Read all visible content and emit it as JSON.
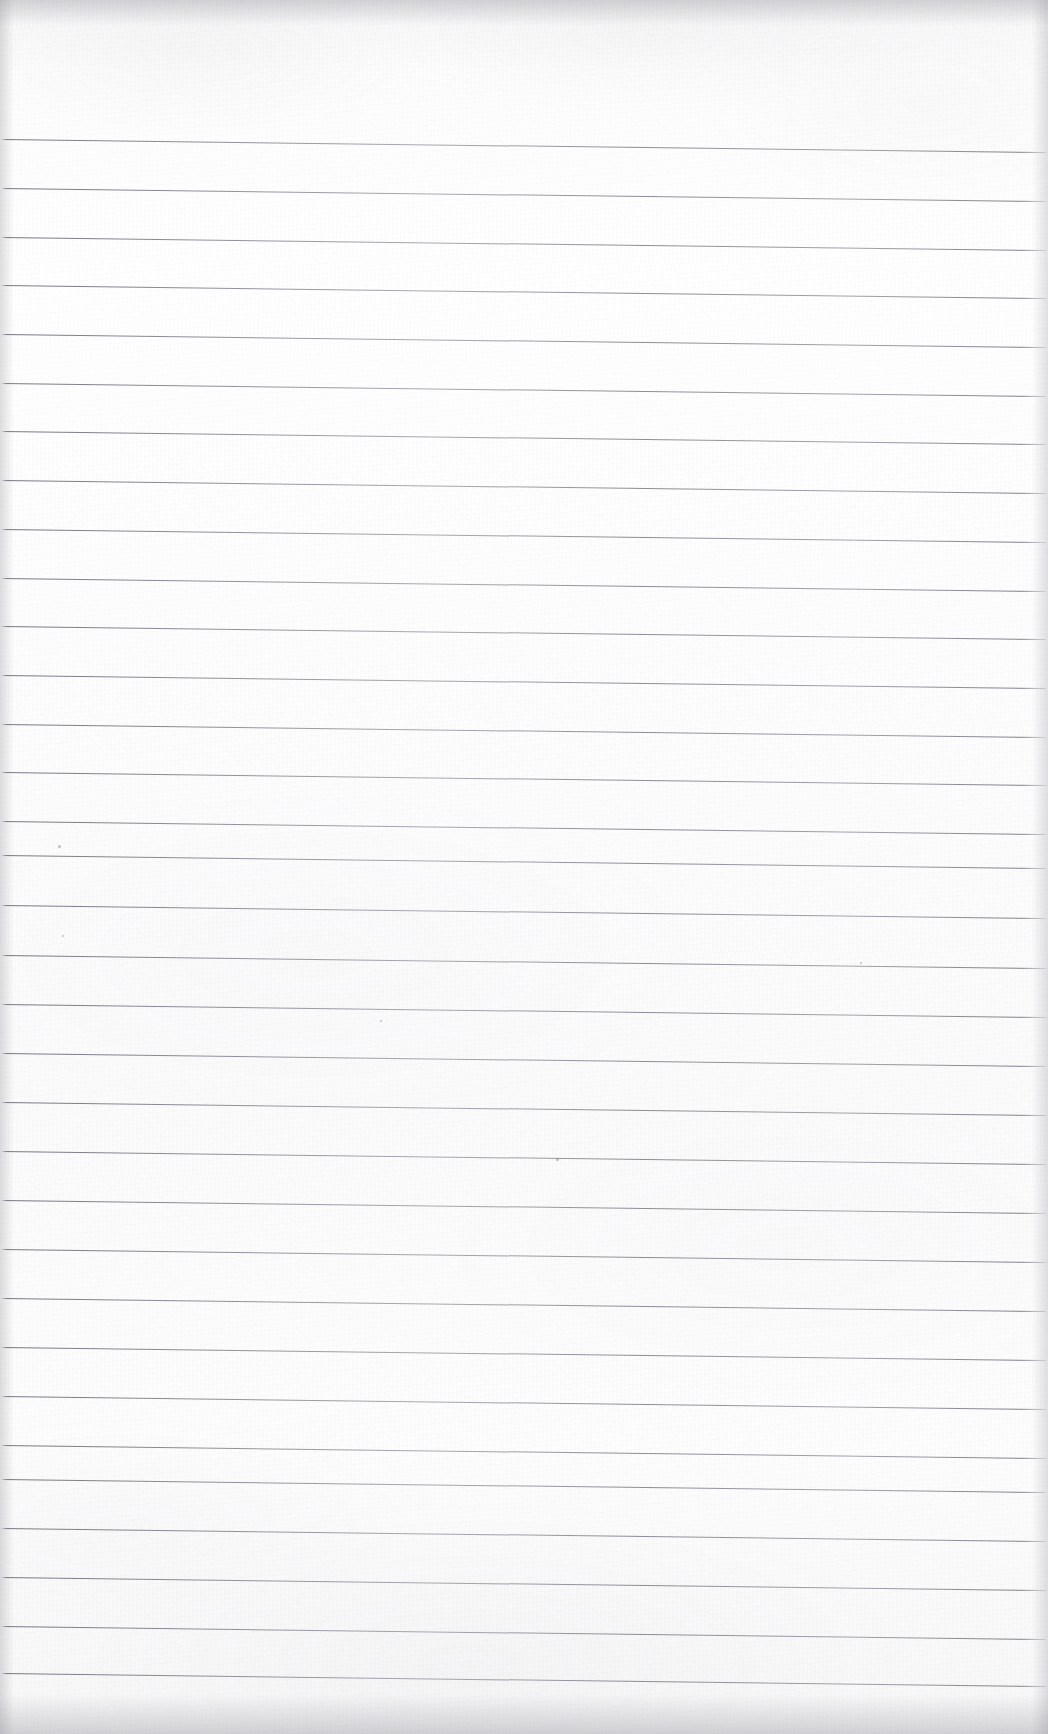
{
  "document": {
    "kind": "scanned-ruled-notebook-page",
    "title": "Blank Lined Paper Scan",
    "page_width": 1048,
    "page_height": 1734,
    "text_content": "",
    "handwriting": "none",
    "printed_text": "none"
  },
  "paper": {
    "background_color": "#fdfdfe",
    "tint_color": "#f7f7f8",
    "edge_shadow_color": "#7d7d87",
    "texture": "fibrous scan grain with faint cloudy blotches"
  },
  "ruling": {
    "line_color": "#6c6c78",
    "line_thickness_px": 1,
    "line_spacing_px": 49,
    "line_count": 32,
    "first_line_y_px": 139,
    "last_line_y_px": 1673,
    "left_margin_px": 2,
    "right_end_px": 1046,
    "slope_degrees": 0.72,
    "slope_direction": "descending-left-to-right",
    "vertical_margin_rule": "none",
    "top_blank_band_px": 139,
    "bottom_blank_band_px": 61,
    "lines": [
      {
        "index": 1,
        "y": 139
      },
      {
        "index": 2,
        "y": 188
      },
      {
        "index": 3,
        "y": 237
      },
      {
        "index": 4,
        "y": 285
      },
      {
        "index": 5,
        "y": 334
      },
      {
        "index": 6,
        "y": 383
      },
      {
        "index": 7,
        "y": 431
      },
      {
        "index": 8,
        "y": 480
      },
      {
        "index": 9,
        "y": 529
      },
      {
        "index": 10,
        "y": 578
      },
      {
        "index": 11,
        "y": 626
      },
      {
        "index": 12,
        "y": 675
      },
      {
        "index": 13,
        "y": 724
      },
      {
        "index": 14,
        "y": 772
      },
      {
        "index": 15,
        "y": 821
      },
      {
        "index": 16,
        "y": 855
      },
      {
        "index": 17,
        "y": 905
      },
      {
        "index": 18,
        "y": 955
      },
      {
        "index": 19,
        "y": 1004
      },
      {
        "index": 20,
        "y": 1053
      },
      {
        "index": 21,
        "y": 1102
      },
      {
        "index": 22,
        "y": 1151
      },
      {
        "index": 23,
        "y": 1200
      },
      {
        "index": 24,
        "y": 1249
      },
      {
        "index": 25,
        "y": 1298
      },
      {
        "index": 26,
        "y": 1347
      },
      {
        "index": 27,
        "y": 1396
      },
      {
        "index": 28,
        "y": 1445
      },
      {
        "index": 29,
        "y": 1479
      },
      {
        "index": 30,
        "y": 1528
      },
      {
        "index": 31,
        "y": 1577
      },
      {
        "index": 32,
        "y": 1626
      },
      {
        "index": 33,
        "y": 1673
      }
    ]
  },
  "artifacts": {
    "specks": [
      {
        "name": "speck-upper-left",
        "x": 58,
        "y": 845,
        "size": 3
      },
      {
        "name": "speck-mid-left",
        "x": 62,
        "y": 935,
        "size": 2
      },
      {
        "name": "speck-center",
        "x": 556,
        "y": 1158,
        "size": 3
      },
      {
        "name": "speck-right-rule",
        "x": 860,
        "y": 962,
        "size": 2
      },
      {
        "name": "speck-lower-center",
        "x": 380,
        "y": 1020,
        "size": 2
      }
    ]
  }
}
